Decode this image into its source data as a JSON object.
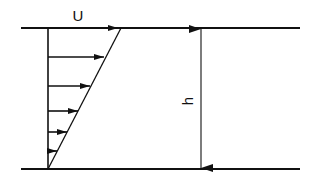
{
  "diagram": {
    "type": "couette-flow-velocity-profile",
    "labels": {
      "velocity": "U",
      "height": "h"
    },
    "colors": {
      "line": "#111111",
      "background": "#ffffff"
    },
    "plates": {
      "top": {
        "x1": 21,
        "x2": 300,
        "y": 28
      },
      "bottom": {
        "x1": 21,
        "x2": 300,
        "y": 169
      }
    },
    "wall_x": 48,
    "profile_line": {
      "x1": 48,
      "y1": 169,
      "x2": 121,
      "y2": 28
    },
    "velocity_arrows": [
      {
        "y": 28,
        "tip_x": 118
      },
      {
        "y": 57,
        "tip_x": 104
      },
      {
        "y": 86,
        "tip_x": 90
      },
      {
        "y": 111,
        "tip_x": 78
      },
      {
        "y": 132,
        "tip_x": 67
      },
      {
        "y": 151,
        "tip_x": 57
      }
    ],
    "dimension": {
      "x": 201,
      "y1": 28,
      "y2": 169
    }
  }
}
